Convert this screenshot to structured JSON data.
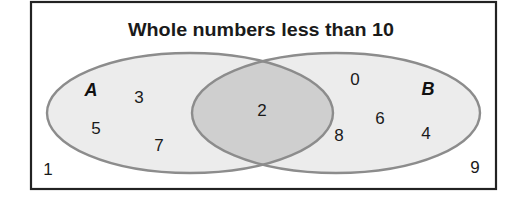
{
  "title": "Whole numbers less than 10",
  "colors": {
    "frame_stroke": "#222222",
    "set_fill": "#ececec",
    "intersection_fill": "#cfcfcf",
    "set_stroke": "#8c8c8c",
    "text": "#1a1a1a"
  },
  "sets": [
    {
      "label": "A",
      "only_elements": [
        "3",
        "5",
        "7"
      ]
    },
    {
      "label": "B",
      "only_elements": [
        "0",
        "6",
        "8",
        "4"
      ]
    }
  ],
  "intersection": {
    "elements": [
      "2"
    ]
  },
  "outside": {
    "elements": [
      "1",
      "9"
    ]
  },
  "labels": {
    "set_a": "A",
    "set_b": "B"
  },
  "numbers": {
    "n0": "0",
    "n1": "1",
    "n2": "2",
    "n3": "3",
    "n4": "4",
    "n5": "5",
    "n6": "6",
    "n7": "7",
    "n8": "8",
    "n9": "9"
  }
}
